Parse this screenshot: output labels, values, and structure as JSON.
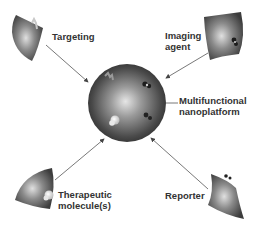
{
  "diagram": {
    "center": {
      "label_line1": "Multifunctional",
      "label_line2": "nanoplatform"
    },
    "components": [
      {
        "id": "targeting",
        "label_line1": "Targeting",
        "label_line2": ""
      },
      {
        "id": "imaging",
        "label_line1": "Imaging",
        "label_line2": "agent"
      },
      {
        "id": "therapeutic",
        "label_line1": "Therapeutic",
        "label_line2": "molecule(s)"
      },
      {
        "id": "reporter",
        "label_line1": "Reporter",
        "label_line2": ""
      }
    ],
    "colors": {
      "sphere_light": "#d8d8d8",
      "sphere_dark": "#3a3a3a",
      "arrow": "#555555",
      "text": "#333333"
    }
  }
}
